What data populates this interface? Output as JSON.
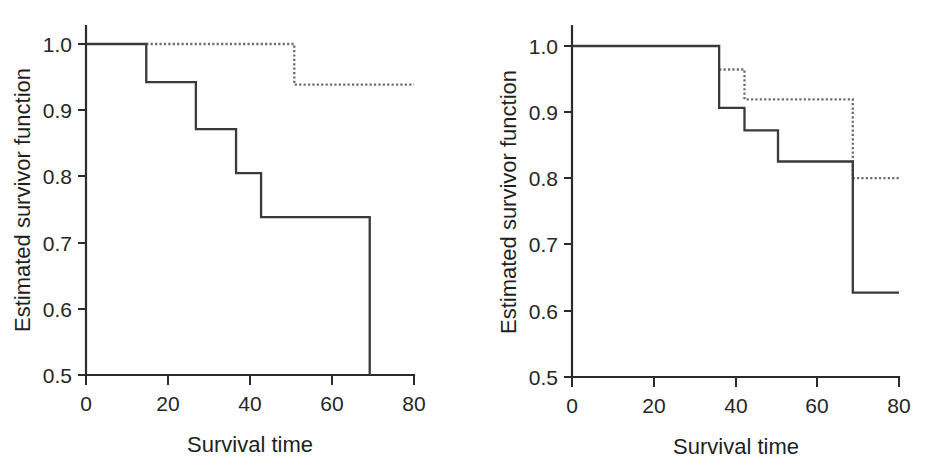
{
  "figure": {
    "background": "#ffffff",
    "panel_count": 2
  },
  "chart_data": [
    {
      "type": "line",
      "panel": "left",
      "title": "",
      "xlabel": "Survival time",
      "ylabel": "Estimated survivor function",
      "xlim": [
        0,
        80
      ],
      "ylim": [
        0.5,
        1.0
      ],
      "xticks": [
        0,
        20,
        40,
        60,
        80
      ],
      "yticks": [
        "0.5",
        "0.6",
        "0.7",
        "0.8",
        "0.9",
        "1.0"
      ],
      "xtick_labels": [
        "0",
        "20",
        "40",
        "60",
        "80"
      ],
      "grid": false,
      "legend": null,
      "step_interpolation": "post",
      "series": [
        {
          "name": "solid-curve",
          "style": "solid",
          "color": "#3a3a3a",
          "x": [
            0,
            14.7,
            14.7,
            26.8,
            26.8,
            36.6,
            36.6,
            42.7,
            42.7,
            69.2,
            69.2
          ],
          "y": [
            1.0,
            1.0,
            0.9425,
            0.9425,
            0.8715,
            0.8715,
            0.805,
            0.805,
            0.7385,
            0.7385,
            0.5
          ]
        },
        {
          "name": "dotted-curve",
          "style": "dotted",
          "color": "#6d6d6d",
          "x": [
            14.7,
            50.8,
            50.8,
            80
          ],
          "y": [
            1.0,
            1.0,
            0.9385,
            0.9385
          ]
        }
      ]
    },
    {
      "type": "line",
      "panel": "right",
      "title": "",
      "xlabel": "Survival time",
      "ylabel": "Estimated survivor function",
      "xlim": [
        0,
        80
      ],
      "ylim": [
        0.5,
        1.0
      ],
      "xticks": [
        0,
        20,
        40,
        60,
        80
      ],
      "yticks": [
        "0.5",
        "0.6",
        "0.7",
        "0.8",
        "0.9",
        "1.0"
      ],
      "xtick_labels": [
        "0",
        "20",
        "40",
        "60",
        "80"
      ],
      "grid": false,
      "legend": null,
      "step_interpolation": "post",
      "series": [
        {
          "name": "solid-curve",
          "style": "solid",
          "color": "#3a3a3a",
          "x": [
            0,
            36.0,
            36.0,
            42.2,
            42.2,
            50.4,
            50.4,
            68.7,
            68.7,
            80
          ],
          "y": [
            1.0,
            1.0,
            0.9065,
            0.9065,
            0.8725,
            0.8725,
            0.8255,
            0.8255,
            0.6275,
            0.6275
          ]
        },
        {
          "name": "dotted-curve",
          "style": "dotted",
          "color": "#6d6d6d",
          "x": [
            36.0,
            42.2,
            42.2,
            68.7,
            68.7,
            80
          ],
          "y": [
            0.9645,
            0.9645,
            0.9195,
            0.9195,
            0.8005,
            0.8005
          ]
        }
      ]
    }
  ],
  "panels": {
    "left": {
      "name": "left-panel",
      "xlabel": "Survival time",
      "ylabel": "Estimated survivor function",
      "xtick_labels": [
        "0",
        "20",
        "40",
        "60",
        "80"
      ],
      "ytick_labels": [
        "0.5",
        "0.6",
        "0.7",
        "0.8",
        "0.9",
        "1.0"
      ]
    },
    "right": {
      "name": "right-panel",
      "xlabel": "Survival time",
      "ylabel": "Estimated survivor function",
      "xtick_labels": [
        "0",
        "20",
        "40",
        "60",
        "80"
      ],
      "ytick_labels": [
        "0.5",
        "0.6",
        "0.7",
        "0.8",
        "0.9",
        "1.0"
      ]
    }
  },
  "colors": {
    "axis": "#2b2b2b",
    "solid_curve": "#3a3a3a",
    "dotted_curve": "#6d6d6d",
    "text": "#1f1f1f",
    "background": "#ffffff"
  }
}
